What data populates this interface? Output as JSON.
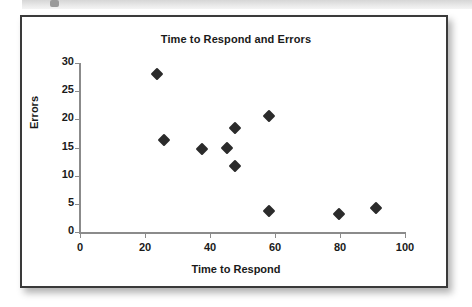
{
  "page": {
    "background_color": "#ffffff",
    "card_border_color": "#3a3a3a",
    "top_bar_color": "#e3e3e3"
  },
  "chart_data": {
    "type": "scatter",
    "title": "Time to Respond and Errors",
    "xlabel": "Time to Respond",
    "ylabel": "Errors",
    "xlim": [
      0,
      100
    ],
    "ylim": [
      0,
      30
    ],
    "xticks": [
      0,
      20,
      40,
      60,
      80,
      100
    ],
    "yticks": [
      0,
      5,
      10,
      15,
      20,
      25,
      30
    ],
    "grid": false,
    "legend": null,
    "marker_style": "filled-diamond",
    "marker_color": "#2b2b2b",
    "axis_color": "#8b8b8b",
    "points": [
      {
        "x": 23.7,
        "y": 28.0
      },
      {
        "x": 25.8,
        "y": 16.3
      },
      {
        "x": 37.5,
        "y": 14.7
      },
      {
        "x": 45.2,
        "y": 15.0
      },
      {
        "x": 47.7,
        "y": 18.5
      },
      {
        "x": 47.7,
        "y": 11.7
      },
      {
        "x": 58.2,
        "y": 20.6
      },
      {
        "x": 58.2,
        "y": 3.7
      },
      {
        "x": 79.7,
        "y": 3.2
      },
      {
        "x": 91.1,
        "y": 4.3
      }
    ]
  }
}
